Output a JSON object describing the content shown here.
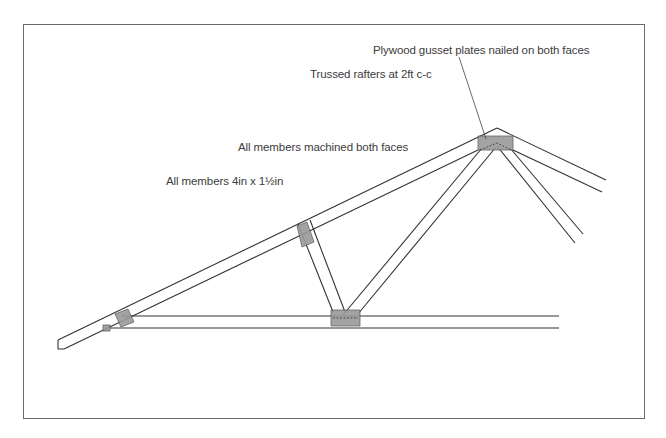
{
  "diagram": {
    "type": "roof-truss-elevation",
    "annotations": [
      {
        "id": "gusset",
        "text": "Plywood gusset plates nailed on both faces"
      },
      {
        "id": "trussed",
        "text": "Trussed rafters at 2ft c-c"
      },
      {
        "id": "machined",
        "text": "All members machined both faces"
      },
      {
        "id": "members",
        "text": "All members 4in x 1½in"
      }
    ],
    "components": [
      "left-rafter",
      "right-rafter",
      "tie-beam",
      "short-web",
      "long-web",
      "right-web",
      "apex-gusset",
      "centre-gusset",
      "mid-rafter-gusset",
      "heel-gusset",
      "heel-block"
    ],
    "colors": {
      "line": "#333333",
      "gusset_fill": "#9a9a9a",
      "frame": "#6b6b6b"
    }
  }
}
